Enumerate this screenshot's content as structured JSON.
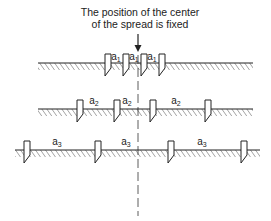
{
  "caption": {
    "line1": "The position of the center",
    "line2": "of the spread is fixed"
  },
  "rows": [
    {
      "name": "row-1",
      "spacing_label": "a",
      "spacing_sub": "1",
      "ground_y": 63,
      "ground_x": [
        38,
        253
      ],
      "electrodes_x": [
        108,
        126,
        144,
        162
      ],
      "labels": [
        {
          "x": 116,
          "y": 60
        },
        {
          "x": 134,
          "y": 60
        },
        {
          "x": 152,
          "y": 60
        }
      ]
    },
    {
      "name": "row-2",
      "spacing_label": "a",
      "spacing_sub": "2",
      "ground_y": 109,
      "ground_x": [
        38,
        253
      ],
      "electrodes_x": [
        80,
        117,
        153,
        208
      ],
      "labels": [
        {
          "x": 94,
          "y": 104
        },
        {
          "x": 127,
          "y": 104
        },
        {
          "x": 176,
          "y": 104
        }
      ]
    },
    {
      "name": "row-3",
      "spacing_label": "a",
      "spacing_sub": "3",
      "ground_y": 150,
      "ground_x": [
        15,
        260
      ],
      "electrodes_x": [
        27,
        98,
        171,
        244
      ],
      "labels": [
        {
          "x": 57,
          "y": 145
        },
        {
          "x": 126,
          "y": 145
        },
        {
          "x": 202,
          "y": 145
        }
      ]
    }
  ],
  "center_line_x": 138,
  "colors": {
    "ink": "#222222",
    "background": "#ffffff"
  }
}
